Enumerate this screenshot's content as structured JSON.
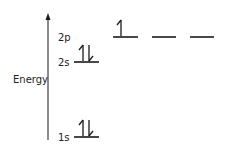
{
  "diagram": {
    "type": "orbital-energy-diagram",
    "axis_label": "Energy",
    "line_color": "#1a1a1a",
    "levels": [
      {
        "name": "1s",
        "label": "1s",
        "orbitals": 1,
        "electrons": [
          "up",
          "down"
        ]
      },
      {
        "name": "2s",
        "label": "2s",
        "orbitals": 1,
        "electrons": [
          "up",
          "down"
        ]
      },
      {
        "name": "2p",
        "label": "2p",
        "orbitals": 3,
        "electrons": [
          [
            "up"
          ],
          [],
          []
        ]
      }
    ]
  }
}
